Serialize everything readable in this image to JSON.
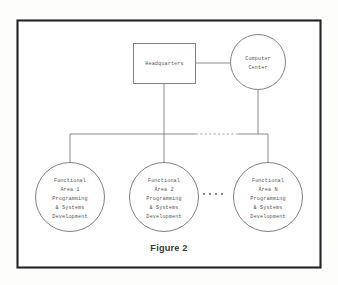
{
  "figure": {
    "caption": "Figure 2",
    "background_color": "#ffffff",
    "border_color": "#242428",
    "line_color": "#77777c",
    "text_color": "#56565a"
  },
  "nodes": {
    "headquarters": {
      "id": "headquarters",
      "shape": "rectangle",
      "label": "Headquarters",
      "lines": [
        "Headquarters"
      ]
    },
    "computer_center": {
      "id": "computer-center",
      "shape": "circle",
      "label": "Computer Center",
      "lines": [
        "Computer",
        "Center"
      ]
    },
    "functional_area_1": {
      "id": "functional-area-1",
      "shape": "circle",
      "label": "Functional Area 1 Programming & Systems Development",
      "lines": [
        "Functional",
        "Area 1",
        "Programming",
        "& Systems",
        "Development"
      ]
    },
    "functional_area_2": {
      "id": "functional-area-2",
      "shape": "circle",
      "label": "Functional Area 2 Programming & Systems Development",
      "lines": [
        "Functional",
        "Area 2",
        "Programming",
        "& Systems",
        "Development"
      ]
    },
    "functional_area_n": {
      "id": "functional-area-n",
      "shape": "circle",
      "label": "Functional Area N Programming & Systems Development",
      "lines": [
        "Functional",
        "Area N",
        "Programming",
        "& Systems",
        "Development"
      ]
    }
  },
  "ellipsis": {
    "between_nodes": "more functional areas",
    "dot_count": 4
  },
  "connectors": [
    {
      "name": "headquarters-to-computer-center",
      "style": "solid"
    },
    {
      "name": "headquarters-to-bus",
      "style": "solid"
    },
    {
      "name": "computer-center-to-bus",
      "style": "solid"
    },
    {
      "name": "bus-left-segment",
      "style": "solid"
    },
    {
      "name": "bus-middle-segment",
      "style": "dashed"
    },
    {
      "name": "bus-right-segment",
      "style": "solid"
    },
    {
      "name": "bus-to-functional-area-1",
      "style": "solid"
    },
    {
      "name": "bus-to-functional-area-2",
      "style": "solid"
    },
    {
      "name": "bus-to-functional-area-n",
      "style": "solid"
    }
  ]
}
